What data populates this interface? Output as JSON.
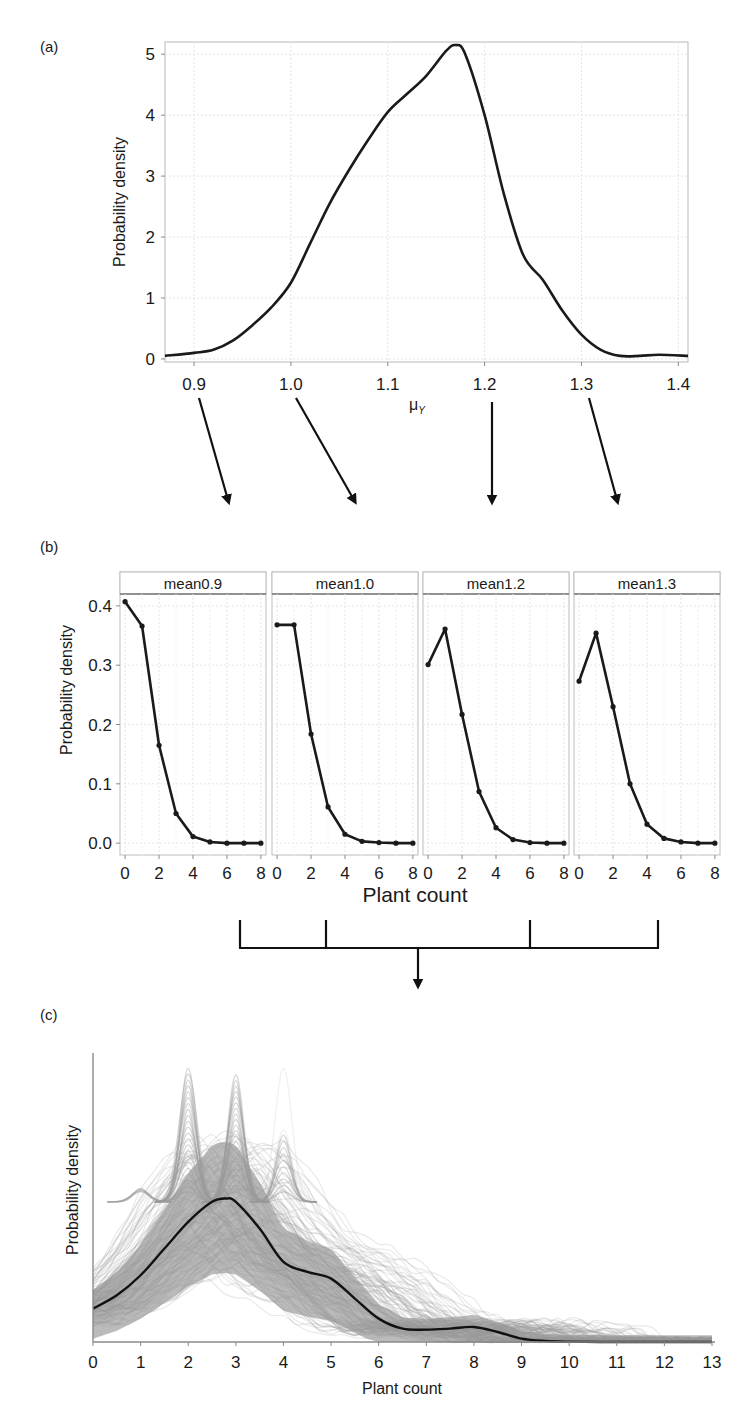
{
  "figure": {
    "panel_labels": [
      "(a)",
      "(b)",
      "(c)"
    ]
  },
  "chart_data": [
    {
      "id": "a",
      "type": "line",
      "title": "",
      "xlabel": "μ_Y",
      "xlabel_main": "μ",
      "xlabel_sub": "Y",
      "ylabel": "Probability density",
      "xlim": [
        0.87,
        1.41
      ],
      "ylim": [
        0,
        5.2
      ],
      "xticks": [
        "0.9",
        "1.0",
        "1.1",
        "1.2",
        "1.3",
        "1.4"
      ],
      "xtick_values": [
        0.9,
        1.0,
        1.1,
        1.2,
        1.3,
        1.4
      ],
      "yticks": [
        "0",
        "1",
        "2",
        "3",
        "4",
        "5"
      ],
      "ytick_values": [
        0,
        1,
        2,
        3,
        4,
        5
      ],
      "grid": true,
      "series": [
        {
          "name": "posterior density of μ_Y",
          "x": [
            0.87,
            0.9,
            0.92,
            0.94,
            0.96,
            0.98,
            1.0,
            1.02,
            1.04,
            1.06,
            1.08,
            1.1,
            1.12,
            1.14,
            1.16,
            1.17,
            1.18,
            1.2,
            1.22,
            1.24,
            1.26,
            1.28,
            1.3,
            1.32,
            1.34,
            1.36,
            1.38,
            1.41
          ],
          "y": [
            0.05,
            0.1,
            0.15,
            0.3,
            0.55,
            0.85,
            1.25,
            1.9,
            2.55,
            3.1,
            3.6,
            4.05,
            4.35,
            4.65,
            5.05,
            5.15,
            5.0,
            4.0,
            2.7,
            1.7,
            1.3,
            0.8,
            0.4,
            0.15,
            0.05,
            0.05,
            0.07,
            0.05
          ]
        }
      ]
    },
    {
      "id": "b",
      "type": "line",
      "title": "",
      "xlabel": "Plant count",
      "ylabel": "Probability density",
      "ylim": [
        -0.02,
        0.42
      ],
      "xlim": [
        -0.3,
        8.3
      ],
      "yticks": [
        "0.0",
        "0.1",
        "0.2",
        "0.3",
        "0.4"
      ],
      "ytick_values": [
        0,
        0.1,
        0.2,
        0.3,
        0.4
      ],
      "xticks": [
        "0",
        "2",
        "4",
        "6",
        "8"
      ],
      "xtick_values": [
        0,
        2,
        4,
        6,
        8
      ],
      "grid": true,
      "facets": [
        {
          "label": "mean0.9",
          "x": [
            0,
            1,
            2,
            3,
            4,
            5,
            6,
            7,
            8
          ],
          "y": [
            0.407,
            0.366,
            0.165,
            0.05,
            0.011,
            0.002,
            0.0,
            0.0,
            0.0
          ]
        },
        {
          "label": "mean1.0",
          "x": [
            0,
            1,
            2,
            3,
            4,
            5,
            6,
            7,
            8
          ],
          "y": [
            0.368,
            0.368,
            0.184,
            0.061,
            0.015,
            0.003,
            0.001,
            0.0,
            0.0
          ]
        },
        {
          "label": "mean1.2",
          "x": [
            0,
            1,
            2,
            3,
            4,
            5,
            6,
            7,
            8
          ],
          "y": [
            0.301,
            0.361,
            0.217,
            0.087,
            0.026,
            0.006,
            0.001,
            0.0,
            0.0
          ]
        },
        {
          "label": "mean1.3",
          "x": [
            0,
            1,
            2,
            3,
            4,
            5,
            6,
            7,
            8
          ],
          "y": [
            0.273,
            0.354,
            0.23,
            0.1,
            0.032,
            0.008,
            0.002,
            0.0,
            0.0
          ]
        }
      ]
    },
    {
      "id": "c",
      "type": "line",
      "title": "",
      "xlabel": "Plant count",
      "ylabel": "Probability density",
      "xlim": [
        0,
        13
      ],
      "xticks": [
        "0",
        "1",
        "2",
        "3",
        "4",
        "5",
        "6",
        "7",
        "8",
        "9",
        "10",
        "11",
        "12",
        "13"
      ],
      "xtick_values": [
        0,
        1,
        2,
        3,
        4,
        5,
        6,
        7,
        8,
        9,
        10,
        11,
        12,
        13
      ],
      "yticks": [],
      "grid": false,
      "series": [
        {
          "name": "posterior predictive samples (many grey curves)",
          "color": "#9a9a9a",
          "note": "dense band of grey density curves with spikes at 2, 3 and 4"
        },
        {
          "name": "mean predictive density",
          "color": "#111111",
          "x": [
            0,
            0.5,
            1,
            1.5,
            2,
            2.5,
            2.8,
            3.0,
            3.5,
            4.0,
            4.5,
            5.0,
            5.5,
            6.0,
            6.5,
            7.0,
            7.5,
            8.0,
            8.5,
            9.0,
            9.5,
            10,
            11,
            12,
            13
          ],
          "y": [
            0.1,
            0.14,
            0.2,
            0.28,
            0.36,
            0.42,
            0.43,
            0.42,
            0.34,
            0.24,
            0.21,
            0.19,
            0.13,
            0.07,
            0.04,
            0.037,
            0.04,
            0.045,
            0.03,
            0.01,
            0.003,
            0.001,
            0.0,
            0.0,
            0.0
          ]
        }
      ]
    }
  ]
}
